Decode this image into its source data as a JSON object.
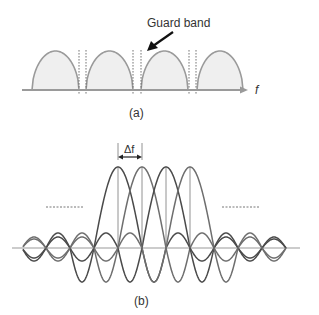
{
  "figure_a": {
    "annotation": "Guard band",
    "axis_label": "f",
    "caption": "(a)",
    "subcarriers": 4,
    "arches": [
      [
        32,
        79
      ],
      [
        86,
        133
      ],
      [
        141,
        188
      ],
      [
        197,
        243
      ]
    ],
    "guard_lines": [
      79,
      86,
      133,
      141,
      189,
      196
    ],
    "baseline_y": 90,
    "peak_y": 51
  },
  "figure_b": {
    "spacing_label": "Δf",
    "caption": "(b)",
    "peaks_x": [
      118,
      142,
      166,
      190
    ],
    "baseline_y": 248,
    "peak_height": 81,
    "spacing_px": 24,
    "sidelobe_amplitudes": [
      34,
      15,
      13,
      11,
      10,
      9,
      8
    ],
    "ellipsis_left": [
      46,
      84
    ],
    "ellipsis_right": [
      222,
      260
    ],
    "ellipsis_y": 207
  },
  "colors": {
    "arch_stroke": "#9a9a9a",
    "arch_fill": "#efefef",
    "axis": "#999999",
    "curve_dark": "#4a4a4a",
    "curve_mid": "#6e6e6e",
    "text": "#333333"
  }
}
